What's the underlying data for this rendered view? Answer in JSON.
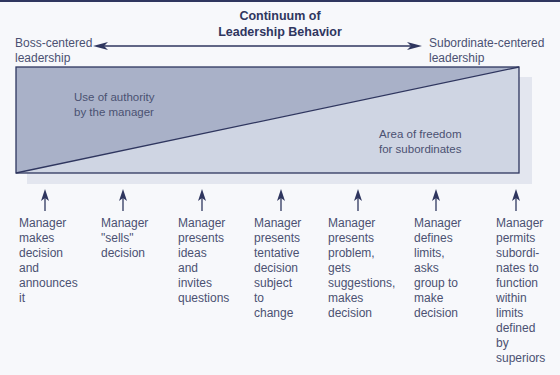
{
  "title": {
    "line1": "Continuum of",
    "line2": "Leadership Behavior"
  },
  "continuum": {
    "left_label_line1": "Boss-centered",
    "left_label_line2": "leadership",
    "right_label_line1": "Subordinate-centered",
    "right_label_line2": "leadership"
  },
  "regions": {
    "authority_line1": "Use of authority",
    "authority_line2": "by the manager",
    "freedom_line1": "Area of freedom",
    "freedom_line2": "for subordinates"
  },
  "colors": {
    "navy": "#2f365f",
    "authority_fill": "#a9b1c8",
    "freedom_fill": "#cfd5e3",
    "shadow": "#e3e6ef",
    "text": "#4b5172"
  },
  "behaviors": [
    {
      "text": "Manager\nmakes\ndecision\nand\nannounces\nit"
    },
    {
      "text": "Manager\n\"sells\"\ndecision"
    },
    {
      "text": "Manager\npresents\nideas\nand\ninvites\nquestions"
    },
    {
      "text": "Manager\npresents\ntentative\ndecision\nsubject\nto change"
    },
    {
      "text": "Manager\npresents\nproblem,\ngets\nsuggestions,\nmakes\ndecision"
    },
    {
      "text": "Manager\ndefines\nlimits,\nasks\ngroup to\nmake\ndecision"
    },
    {
      "text": "Manager\npermits\nsubordi-\nnates to\nfunction\nwithin\nlimits\ndefined\nby\nsuperiors"
    }
  ]
}
